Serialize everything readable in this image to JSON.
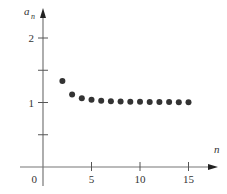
{
  "chart_data": {
    "type": "scatter",
    "title": "",
    "xlabel": "n",
    "ylabel": "a_n",
    "ylabel_main": "a",
    "ylabel_sub": "n",
    "x_ticks": [
      5,
      10,
      15
    ],
    "x_tick_labels": [
      "5",
      "10",
      "15"
    ],
    "y_ticks": [
      0.5,
      1,
      1.5,
      2
    ],
    "y_tick_labels": [
      "",
      "1",
      "",
      "2"
    ],
    "origin_label": "0",
    "xlim": [
      0,
      16
    ],
    "ylim": [
      -0.2,
      2.4
    ],
    "grid": false,
    "legend": null,
    "x": [
      2,
      3,
      4,
      5,
      6,
      7,
      8,
      9,
      10,
      11,
      12,
      13,
      14,
      15
    ],
    "values": [
      1.333,
      1.125,
      1.067,
      1.042,
      1.029,
      1.021,
      1.016,
      1.013,
      1.01,
      1.008,
      1.007,
      1.006,
      1.005,
      1.004
    ],
    "point_color": "#333333"
  }
}
